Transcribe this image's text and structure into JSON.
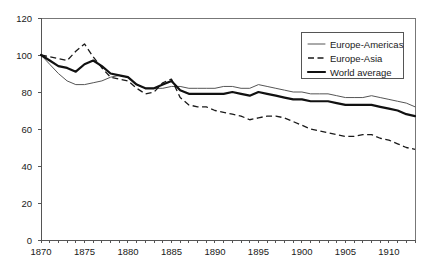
{
  "chart_data": {
    "type": "line",
    "title": "",
    "subtitle": "",
    "xlabel": "",
    "ylabel": "",
    "xlim": [
      1870,
      1913
    ],
    "ylim": [
      0,
      120
    ],
    "ytick_step": 20,
    "xtick_step": 5,
    "minor_xtick_step": 1,
    "grid": false,
    "legend_position": "top-right",
    "yticks": [
      "0",
      "20",
      "40",
      "60",
      "80",
      "100",
      "120"
    ],
    "xticks": [
      "1870",
      "1875",
      "1880",
      "1885",
      "1890",
      "1895",
      "1900",
      "1905",
      "1910"
    ],
    "x": [
      1870,
      1871,
      1872,
      1873,
      1874,
      1875,
      1876,
      1877,
      1878,
      1879,
      1880,
      1881,
      1882,
      1883,
      1884,
      1885,
      1886,
      1887,
      1888,
      1889,
      1890,
      1891,
      1892,
      1893,
      1894,
      1895,
      1896,
      1897,
      1898,
      1899,
      1900,
      1901,
      1902,
      1903,
      1904,
      1905,
      1906,
      1907,
      1908,
      1909,
      1910,
      1911,
      1912,
      1913
    ],
    "series": [
      {
        "name": "Europe-Americas",
        "style": "thin-solid",
        "color": "#555555",
        "values": [
          100,
          95,
          90,
          86,
          84,
          84,
          85,
          86,
          88,
          89,
          88,
          84,
          82,
          82,
          82,
          83,
          83,
          82,
          82,
          82,
          82,
          83,
          83,
          82,
          82,
          84,
          83,
          82,
          81,
          80,
          80,
          79,
          79,
          79,
          78,
          77,
          77,
          77,
          78,
          77,
          76,
          75,
          74,
          72
        ]
      },
      {
        "name": "Europe-Asia",
        "style": "dashed",
        "color": "#1a1a1a",
        "values": [
          100,
          99,
          98,
          97,
          102,
          106,
          99,
          93,
          88,
          87,
          86,
          82,
          79,
          80,
          85,
          87,
          77,
          73,
          72,
          72,
          70,
          69,
          68,
          67,
          65,
          66,
          67,
          67,
          66,
          64,
          62,
          60,
          59,
          58,
          57,
          56,
          56,
          57,
          57,
          55,
          54,
          52,
          50,
          49
        ]
      },
      {
        "name": "World average",
        "style": "thick-solid",
        "color": "#111111",
        "values": [
          100,
          97,
          94,
          93,
          91,
          95,
          97,
          94,
          90,
          89,
          88,
          84,
          82,
          82,
          84,
          86,
          81,
          79,
          79,
          79,
          79,
          79,
          80,
          79,
          78,
          80,
          79,
          78,
          77,
          76,
          76,
          75,
          75,
          75,
          74,
          73,
          73,
          73,
          73,
          72,
          71,
          70,
          68,
          67
        ]
      }
    ],
    "legend": [
      {
        "label": "Europe-Americas",
        "style": "thin-solid"
      },
      {
        "label": "Europe-Asia",
        "style": "dashed"
      },
      {
        "label": "World average",
        "style": "thick-solid"
      }
    ]
  }
}
